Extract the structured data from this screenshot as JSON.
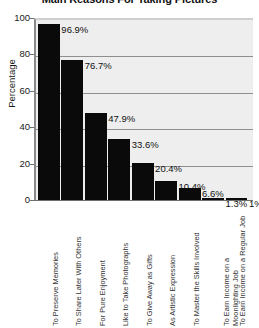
{
  "chart_data": {
    "type": "bar",
    "title": "Main Reasons For Taking Pictures",
    "xlabel": "",
    "ylabel": "Percentage",
    "ylim": [
      0,
      100
    ],
    "yticks": [
      0,
      20,
      40,
      60,
      80,
      100
    ],
    "ytick_labels": [
      "0",
      "20",
      "40",
      "60",
      "80",
      "100"
    ],
    "grid": true,
    "legend": "none",
    "bar_color": "#0a0a0a",
    "plot_background": "#eeeeee",
    "categories": [
      "To Preserve Memories",
      "To Share Later With Others",
      "For Pure Enjoyment",
      "Like to Take Photographs",
      "To Give Away as Gifts",
      "As Artistic Expression",
      "To Master the Skills Involved",
      "To Earn Income on a Moonlighting Job",
      "To Earn Income on a Regular Job"
    ],
    "values": [
      96.9,
      76.7,
      47.9,
      33.6,
      20.4,
      10.4,
      6.6,
      1.3,
      1
    ],
    "value_labels": [
      "96.9%",
      "76.7%",
      "47.9%",
      "33.6%",
      "20.4%",
      "10.4%",
      "6.6%",
      "1.3%",
      "1%"
    ]
  }
}
